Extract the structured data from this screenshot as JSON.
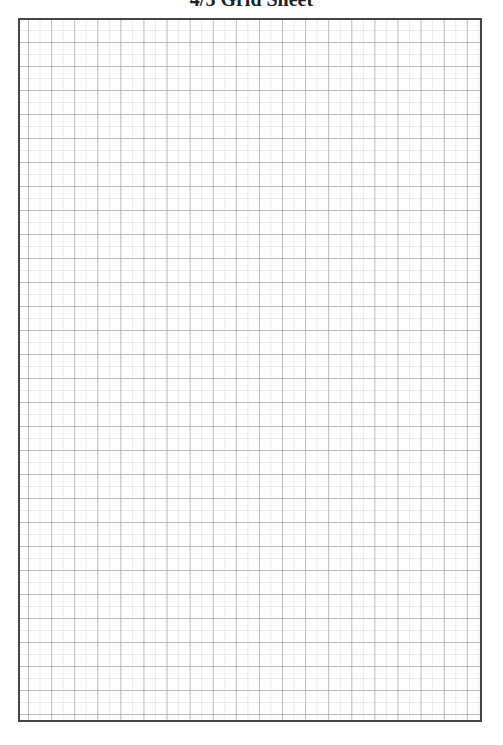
{
  "page": {
    "title": "4/5 Grid Sheet"
  },
  "sheet": {
    "type": "grid-paper",
    "border_color": "#444444",
    "major_line_color": "#969696",
    "minor_line_color": "#c8c8c8",
    "columns": 20,
    "rows": 29
  }
}
